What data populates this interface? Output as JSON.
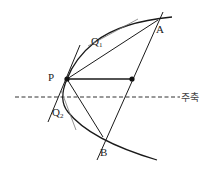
{
  "diagram": {
    "title": "",
    "labels": {
      "P": "P",
      "A": "A",
      "B": "B",
      "Q1": "Q",
      "Q1_sub": "1",
      "Q2": "Q",
      "Q2_sub": "2",
      "axis": "주축"
    },
    "points": {
      "P": [
        67,
        79
      ],
      "A": [
        158,
        20
      ],
      "B": [
        103,
        137
      ],
      "M": [
        132,
        79
      ]
    },
    "colors": {
      "stroke": "#1a1a1a",
      "thin": "#555555",
      "background": "#ffffff"
    }
  }
}
